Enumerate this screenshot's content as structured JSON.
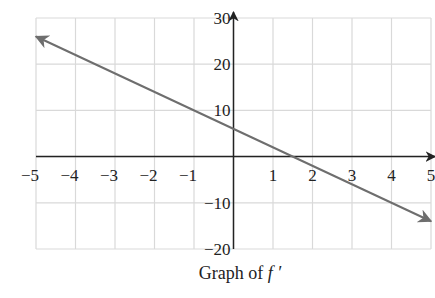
{
  "chart_data": {
    "type": "line",
    "title": "",
    "caption": "Graph of f ′",
    "caption_prefix": "Graph of ",
    "caption_func": "f ′",
    "xlabel": "",
    "ylabel": "",
    "xlim": [
      -5,
      5
    ],
    "ylim": [
      -20,
      30
    ],
    "grid": true,
    "x_ticks": [
      -5,
      -4,
      -3,
      -2,
      -1,
      1,
      2,
      3,
      4,
      5
    ],
    "x_tick_labels": [
      "−5",
      "−4",
      "−3",
      "−2",
      "−1",
      "1",
      "2",
      "3",
      "4",
      "5"
    ],
    "y_ticks": [
      30,
      20,
      10,
      -10,
      -20
    ],
    "y_tick_labels": [
      "30",
      "20",
      "10",
      "−10",
      "−20"
    ],
    "series": [
      {
        "name": "f'",
        "equation": "f'(x) = 6 - 4x",
        "x": [
          -5,
          0,
          1.5,
          5
        ],
        "values": [
          26,
          6,
          0,
          -14
        ],
        "arrows_both_ends": true,
        "color": "#6e6e6e"
      }
    ]
  },
  "colors": {
    "grid": "#d9d9d9",
    "axis": "#222222",
    "line": "#6e6e6e"
  }
}
